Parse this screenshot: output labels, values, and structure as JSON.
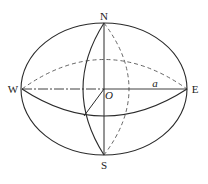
{
  "figure": {
    "type": "sphere-diagram",
    "labels": {
      "north": "N",
      "south": "S",
      "west": "W",
      "east": "E",
      "center": "O",
      "semi_axis": "a"
    },
    "colors": {
      "stroke": "#2a2a2a",
      "dashed_stroke": "#555555",
      "background": "#ffffff"
    }
  }
}
